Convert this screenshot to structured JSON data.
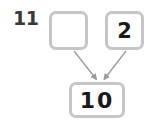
{
  "problem": {
    "number": "11",
    "type": "number-bond-addition"
  },
  "boxes": {
    "addend_left": {
      "value": "",
      "label": "empty-answer-box"
    },
    "addend_right": {
      "value": "2",
      "label": "known-addend-box"
    },
    "sum": {
      "value": "10",
      "label": "sum-box"
    }
  },
  "arrows": [
    {
      "name": "arrow-left-to-sum",
      "from": "addend_left",
      "to": "sum"
    },
    {
      "name": "arrow-right-to-sum",
      "from": "addend_right",
      "to": "sum"
    }
  ],
  "colors": {
    "box_border": "#c6c6c6",
    "box_fill": "#ffffff",
    "text": "#1a1a1a",
    "number_label": "#3a3a3a",
    "arrow": "#9a9a9a",
    "background": "#ffffff"
  }
}
